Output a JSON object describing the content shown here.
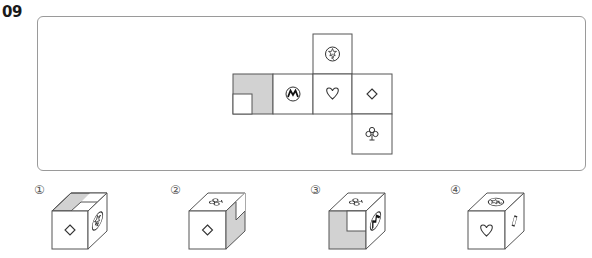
{
  "question": {
    "number": "09"
  },
  "net": {
    "cell_size": 40,
    "cells": [
      {
        "id": "top-circle-star",
        "col": 2,
        "row": 0,
        "symbol": "circle-star-icon"
      },
      {
        "id": "shaded-L",
        "col": 0,
        "row": 1,
        "symbol": "shaded-L-pattern"
      },
      {
        "id": "circle-m",
        "col": 1,
        "row": 1,
        "symbol": "circle-m-icon"
      },
      {
        "id": "heart",
        "col": 2,
        "row": 1,
        "symbol": "heart-icon"
      },
      {
        "id": "diamond",
        "col": 3,
        "row": 1,
        "symbol": "diamond-icon"
      },
      {
        "id": "club",
        "col": 3,
        "row": 2,
        "symbol": "club-icon"
      }
    ]
  },
  "options": [
    {
      "label": "①",
      "front": "diamond-icon",
      "top": "shaded-L-pattern",
      "right": "circle-star-icon"
    },
    {
      "label": "②",
      "front": "diamond-icon",
      "top": "club-icon",
      "right": "shaded-L-pattern"
    },
    {
      "label": "③",
      "front": "shaded-L-pattern",
      "top": "club-icon",
      "right": "circle-m-icon"
    },
    {
      "label": "④",
      "front": "heart-icon",
      "top": "circle-star-icon",
      "right": "diamond-icon"
    }
  ],
  "colors": {
    "line": "#555555",
    "shade": "#d2d2d2",
    "frame": "#9a9a9a"
  }
}
